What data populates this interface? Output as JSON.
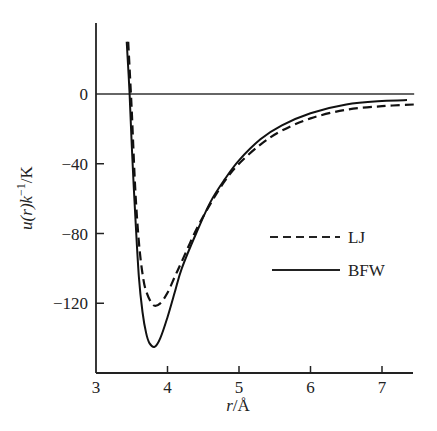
{
  "chart_data": {
    "type": "line",
    "title": "",
    "xlabel": "r/Å",
    "ylabel": "u(r)k⁻¹/K",
    "xlim": [
      3,
      7.45
    ],
    "ylim": [
      -168,
      34
    ],
    "xticks": [
      3,
      4,
      5,
      6,
      7
    ],
    "yticks": [
      0,
      -40,
      -80,
      -120
    ],
    "xtick_labels": [
      "3",
      "4",
      "5",
      "6",
      "7"
    ],
    "ytick_labels": [
      "0",
      "−40",
      "−80",
      "−120"
    ],
    "grid": false,
    "reference_line": {
      "y": 0,
      "x_range": [
        3,
        7.45
      ]
    },
    "legend": {
      "position": "center-right",
      "entries": [
        "LJ",
        "BFW"
      ]
    },
    "series": [
      {
        "name": "LJ",
        "style": "dashed",
        "x": [
          3.45,
          3.5,
          3.55,
          3.6,
          3.65,
          3.7,
          3.8,
          3.9,
          4.0,
          4.1,
          4.2,
          4.4,
          4.6,
          4.8,
          5.0,
          5.3,
          5.6,
          6.0,
          6.5,
          7.0,
          7.45
        ],
        "y": [
          30,
          -10,
          -55,
          -85,
          -103,
          -113,
          -121,
          -120,
          -114,
          -105,
          -96,
          -78,
          -63,
          -50,
          -40,
          -29,
          -21,
          -14,
          -9,
          -7,
          -6
        ]
      },
      {
        "name": "BFW",
        "style": "solid",
        "x": [
          3.43,
          3.47,
          3.5,
          3.55,
          3.6,
          3.65,
          3.7,
          3.75,
          3.82,
          3.9,
          4.0,
          4.1,
          4.2,
          4.4,
          4.6,
          4.8,
          5.0,
          5.3,
          5.6,
          6.0,
          6.5,
          7.0,
          7.35
        ],
        "y": [
          30,
          0,
          -30,
          -70,
          -105,
          -125,
          -137,
          -143,
          -145,
          -140,
          -128,
          -114,
          -100,
          -80,
          -62,
          -49,
          -38,
          -26,
          -18,
          -11,
          -6,
          -4,
          -3.5
        ]
      }
    ]
  },
  "axes": {
    "x_title_var": "r",
    "x_title_unit": "/Å",
    "y_title_func": "u(r)k",
    "y_title_exp": "−1",
    "y_title_unit": "/K"
  },
  "legend": {
    "lj_label": "LJ",
    "bfw_label": "BFW"
  }
}
